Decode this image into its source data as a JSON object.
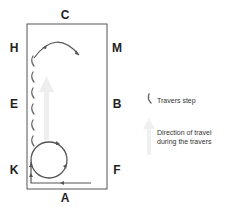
{
  "diagram": {
    "arena_labels": {
      "top": "C",
      "bottom": "A",
      "left_top": "H",
      "left_middle": "E",
      "left_bottom": "K",
      "right_top": "M",
      "right_middle": "B",
      "right_bottom": "F"
    },
    "legend": {
      "travers_step": "Travers step",
      "direction_line1": "Direction of travel",
      "direction_line2": "during the travers"
    },
    "colors": {
      "arena_border": "#555555",
      "path": "#555555",
      "step": "#666666",
      "direction_arrow": "#ececec",
      "label": "#222222"
    }
  }
}
